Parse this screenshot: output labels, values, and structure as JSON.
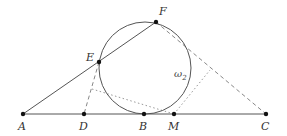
{
  "diagram": {
    "points": [
      {
        "id": "A",
        "label": "A",
        "x": 23,
        "y": 114,
        "lx": 18,
        "ly": 130
      },
      {
        "id": "D",
        "label": "D",
        "x": 84,
        "y": 114,
        "lx": 79,
        "ly": 130
      },
      {
        "id": "B",
        "label": "B",
        "x": 144,
        "y": 114,
        "lx": 139,
        "ly": 130
      },
      {
        "id": "M",
        "label": "M",
        "x": 174,
        "y": 114,
        "lx": 168,
        "ly": 130
      },
      {
        "id": "C",
        "label": "C",
        "x": 266,
        "y": 114,
        "lx": 261,
        "ly": 130
      },
      {
        "id": "E",
        "label": "E",
        "x": 99,
        "y": 62,
        "lx": 86,
        "ly": 61
      },
      {
        "id": "F",
        "label": "F",
        "x": 156,
        "y": 22,
        "lx": 159,
        "ly": 15
      }
    ],
    "circle": {
      "label": "ω",
      "subscript": "2",
      "cx": 145,
      "cy": 68,
      "r": 46,
      "lx": 174,
      "ly": 77
    },
    "segments": [
      {
        "from": "A",
        "to": "C",
        "style": "solid"
      },
      {
        "from": "A",
        "to": "F",
        "style": "solid"
      },
      {
        "from": "F",
        "to": "C",
        "style": "dashed"
      },
      {
        "from": "E",
        "to": "D",
        "style": "dashed"
      }
    ],
    "dotted_paths": [
      {
        "points": [
          [
            92,
            89
          ],
          [
            174,
            114
          ]
        ]
      },
      {
        "points": [
          [
            174,
            114
          ],
          [
            210,
            70
          ]
        ]
      }
    ]
  }
}
